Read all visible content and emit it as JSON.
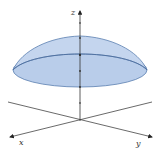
{
  "diagram": {
    "type": "3d-surface-plot",
    "axes": {
      "x": {
        "label": "x"
      },
      "y": {
        "label": "y"
      },
      "z": {
        "label": "z"
      }
    },
    "z_tick_count": 5,
    "colors": {
      "surface_fill": "#b9cdea",
      "surface_stroke": "#5a7fb0",
      "axis": "#333333",
      "background": "#ffffff"
    }
  }
}
